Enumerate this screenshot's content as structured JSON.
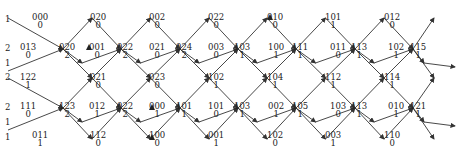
{
  "row_labels": [
    {
      "text": "1",
      "y": 14
    },
    {
      "text": "2",
      "y": 43
    },
    {
      "text": "1",
      "y": 58
    },
    {
      "text": "2",
      "y": 72
    },
    {
      "text": "2",
      "y": 102
    },
    {
      "text": "1",
      "y": 117
    },
    {
      "text": "1",
      "y": 132
    }
  ],
  "nodes": [
    {
      "top": "000",
      "bottom": "0",
      "x": 40,
      "y": 13
    },
    {
      "top": "020",
      "bottom": "0",
      "x": 98,
      "y": 13
    },
    {
      "top": "002",
      "bottom": "0",
      "x": 157,
      "y": 13
    },
    {
      "top": "022",
      "bottom": "0",
      "x": 216,
      "y": 13
    },
    {
      "top": "010",
      "bottom": "0",
      "x": 275,
      "y": 13
    },
    {
      "top": "101",
      "bottom": "1",
      "x": 333,
      "y": 13
    },
    {
      "top": "012",
      "bottom": "0",
      "x": 392,
      "y": 13
    },
    {
      "top": "013",
      "bottom": "0",
      "x": 28,
      "y": 43
    },
    {
      "top": "020",
      "bottom": "2",
      "x": 67,
      "y": 43
    },
    {
      "top": "001",
      "bottom": "0",
      "x": 97,
      "y": 43
    },
    {
      "top": "022",
      "bottom": "2",
      "x": 125,
      "y": 43
    },
    {
      "top": "021",
      "bottom": "0",
      "x": 157,
      "y": 43
    },
    {
      "top": "024",
      "bottom": "2",
      "x": 184,
      "y": 43
    },
    {
      "top": "003",
      "bottom": "0",
      "x": 216,
      "y": 43
    },
    {
      "top": "103",
      "bottom": "1",
      "x": 242,
      "y": 43
    },
    {
      "top": "100",
      "bottom": "1",
      "x": 276,
      "y": 43
    },
    {
      "top": "111",
      "bottom": "1",
      "x": 300,
      "y": 43
    },
    {
      "top": "011",
      "bottom": "0",
      "x": 338,
      "y": 43
    },
    {
      "top": "113",
      "bottom": "1",
      "x": 359,
      "y": 43
    },
    {
      "top": "102",
      "bottom": "1",
      "x": 396,
      "y": 43
    },
    {
      "top": "115",
      "bottom": "1",
      "x": 418,
      "y": 43
    },
    {
      "top": "122",
      "bottom": "1",
      "x": 28,
      "y": 73
    },
    {
      "top": "021",
      "bottom": "0",
      "x": 98,
      "y": 73
    },
    {
      "top": "023",
      "bottom": "0",
      "x": 157,
      "y": 73
    },
    {
      "top": "102",
      "bottom": "1",
      "x": 216,
      "y": 73
    },
    {
      "top": "104",
      "bottom": "1",
      "x": 275,
      "y": 73
    },
    {
      "top": "112",
      "bottom": "1",
      "x": 333,
      "y": 73
    },
    {
      "top": "114",
      "bottom": "1",
      "x": 392,
      "y": 73
    },
    {
      "top": "111",
      "bottom": "0",
      "x": 28,
      "y": 102
    },
    {
      "top": "123",
      "bottom": "2",
      "x": 67,
      "y": 102
    },
    {
      "top": "012",
      "bottom": "1",
      "x": 97,
      "y": 102
    },
    {
      "top": "022",
      "bottom": "2",
      "x": 125,
      "y": 102
    },
    {
      "top": "000",
      "bottom": "1",
      "x": 157,
      "y": 102
    },
    {
      "top": "101",
      "bottom": "1",
      "x": 184,
      "y": 102
    },
    {
      "top": "101",
      "bottom": "0",
      "x": 216,
      "y": 102
    },
    {
      "top": "103",
      "bottom": "1",
      "x": 242,
      "y": 102
    },
    {
      "top": "002",
      "bottom": "1",
      "x": 276,
      "y": 102
    },
    {
      "top": "105",
      "bottom": "1",
      "x": 300,
      "y": 102
    },
    {
      "top": "103",
      "bottom": "0",
      "x": 338,
      "y": 102
    },
    {
      "top": "113",
      "bottom": "1",
      "x": 359,
      "y": 102
    },
    {
      "top": "010",
      "bottom": "1",
      "x": 396,
      "y": 102
    },
    {
      "top": "121",
      "bottom": "1",
      "x": 418,
      "y": 102
    },
    {
      "top": "011",
      "bottom": "1",
      "x": 40,
      "y": 131
    },
    {
      "top": "112",
      "bottom": "0",
      "x": 98,
      "y": 131
    },
    {
      "top": "100",
      "bottom": "0",
      "x": 157,
      "y": 131
    },
    {
      "top": "001",
      "bottom": "1",
      "x": 216,
      "y": 131
    },
    {
      "top": "102",
      "bottom": "0",
      "x": 275,
      "y": 131
    },
    {
      "top": "003",
      "bottom": "1",
      "x": 333,
      "y": 131
    },
    {
      "top": "110",
      "bottom": "0",
      "x": 392,
      "y": 131
    }
  ],
  "markers": [
    {
      "name": "filled-triangle-marker",
      "x": 89,
      "y": 47
    },
    {
      "name": "filled-triangle-marker",
      "x": 152,
      "y": 107
    },
    {
      "name": "filled-triangle-marker",
      "x": 152,
      "y": 137
    },
    {
      "name": "filled-triangle-marker",
      "x": 270,
      "y": 17
    }
  ],
  "colors": {
    "line": "#333333",
    "text": "#222222",
    "background": "#ffffff"
  }
}
